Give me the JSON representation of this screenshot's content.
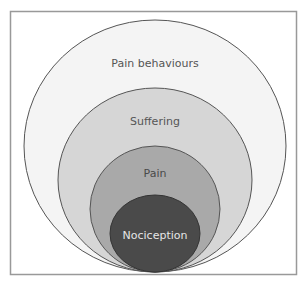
{
  "diagram": {
    "layers": [
      {
        "id": "pain-behaviours",
        "label": "Pain behaviours",
        "fill": "#f4f4f4",
        "text_color": "#555555"
      },
      {
        "id": "suffering",
        "label": "Suffering",
        "fill": "#d6d6d6",
        "text_color": "#555555"
      },
      {
        "id": "pain",
        "label": "Pain",
        "fill": "#a9a9a9",
        "text_color": "#4a4a4a"
      },
      {
        "id": "nociception",
        "label": "Nociception",
        "fill": "#4a4a4a",
        "text_color": "#e6e6e6"
      }
    ],
    "stroke_color": "#555555",
    "frame_color": "#999999"
  }
}
